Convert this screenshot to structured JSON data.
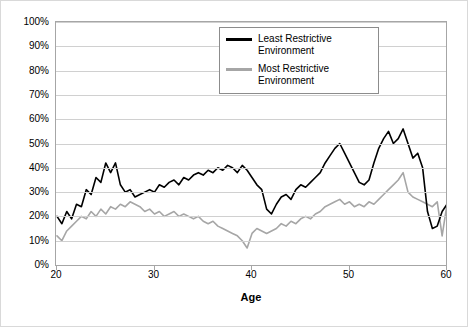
{
  "chart_data": {
    "type": "line",
    "title": "",
    "xlabel": "Age",
    "ylabel": "",
    "xlim": [
      20,
      60
    ],
    "ylim": [
      0,
      1.0
    ],
    "grid": true,
    "legend_position": "top-right-inside",
    "x_ticks": [
      "20",
      "30",
      "40",
      "50",
      "60"
    ],
    "x_tick_values": [
      20,
      30,
      40,
      50,
      60
    ],
    "y_ticks": [
      "0%",
      "10%",
      "20%",
      "30%",
      "40%",
      "50%",
      "60%",
      "70%",
      "80%",
      "90%",
      "100%"
    ],
    "y_tick_values": [
      0,
      0.1,
      0.2,
      0.3,
      0.4,
      0.5,
      0.6,
      0.7,
      0.8,
      0.9,
      1.0
    ],
    "x": [
      20,
      20.5,
      21,
      21.5,
      22,
      22.5,
      23,
      23.5,
      24,
      24.5,
      25,
      25.5,
      26,
      26.5,
      27,
      27.5,
      28,
      28.5,
      29,
      29.5,
      30,
      30.5,
      31,
      31.5,
      32,
      32.5,
      33,
      33.5,
      34,
      34.5,
      35,
      35.5,
      36,
      36.5,
      37,
      37.5,
      38,
      38.5,
      39,
      39.5,
      40,
      40.5,
      41,
      41.5,
      42,
      42.5,
      43,
      43.5,
      44,
      44.5,
      45,
      45.5,
      46,
      46.5,
      47,
      47.5,
      48,
      48.5,
      49,
      49.5,
      50,
      50.5,
      51,
      51.5,
      52,
      52.5,
      53,
      53.5,
      54,
      54.5,
      55,
      55.5,
      56,
      56.5,
      57,
      57.5,
      58,
      58.5,
      59,
      59.5,
      60
    ],
    "series": [
      {
        "name": "Least Restrictive Environment",
        "color": "#000000",
        "values": [
          0.2,
          0.17,
          0.22,
          0.19,
          0.25,
          0.24,
          0.31,
          0.29,
          0.36,
          0.34,
          0.42,
          0.38,
          0.42,
          0.33,
          0.3,
          0.31,
          0.28,
          0.29,
          0.3,
          0.31,
          0.3,
          0.33,
          0.32,
          0.34,
          0.35,
          0.33,
          0.36,
          0.35,
          0.37,
          0.38,
          0.37,
          0.39,
          0.38,
          0.4,
          0.39,
          0.41,
          0.4,
          0.38,
          0.41,
          0.39,
          0.36,
          0.33,
          0.31,
          0.23,
          0.21,
          0.25,
          0.28,
          0.29,
          0.27,
          0.31,
          0.33,
          0.32,
          0.34,
          0.36,
          0.38,
          0.42,
          0.45,
          0.48,
          0.5,
          0.46,
          0.42,
          0.38,
          0.34,
          0.33,
          0.35,
          0.42,
          0.48,
          0.52,
          0.55,
          0.5,
          0.52,
          0.56,
          0.5,
          0.44,
          0.46,
          0.4,
          0.22,
          0.15,
          0.16,
          0.22,
          0.25
        ]
      },
      {
        "name": "Most Restrictive Environment",
        "color": "#a6a6a6",
        "values": [
          0.12,
          0.1,
          0.14,
          0.16,
          0.18,
          0.2,
          0.19,
          0.22,
          0.2,
          0.23,
          0.21,
          0.24,
          0.23,
          0.25,
          0.24,
          0.26,
          0.25,
          0.24,
          0.22,
          0.23,
          0.21,
          0.22,
          0.2,
          0.21,
          0.22,
          0.2,
          0.21,
          0.2,
          0.19,
          0.2,
          0.18,
          0.17,
          0.18,
          0.16,
          0.15,
          0.14,
          0.13,
          0.12,
          0.1,
          0.07,
          0.13,
          0.15,
          0.14,
          0.13,
          0.14,
          0.15,
          0.17,
          0.16,
          0.18,
          0.17,
          0.19,
          0.2,
          0.19,
          0.21,
          0.22,
          0.24,
          0.25,
          0.26,
          0.27,
          0.25,
          0.26,
          0.24,
          0.25,
          0.24,
          0.26,
          0.25,
          0.27,
          0.29,
          0.31,
          0.33,
          0.35,
          0.38,
          0.3,
          0.28,
          0.27,
          0.26,
          0.25,
          0.24,
          0.26,
          0.12,
          0.25
        ]
      }
    ]
  },
  "legend": {
    "items": [
      {
        "label": "Least Restrictive Environment"
      },
      {
        "label": "Most Restrictive Environment"
      }
    ]
  },
  "axis": {
    "x_title": "Age"
  }
}
